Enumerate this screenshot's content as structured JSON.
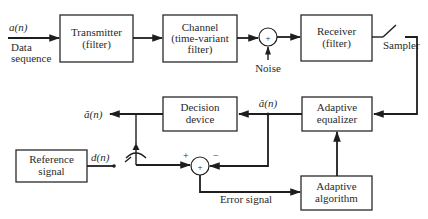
{
  "diagram": {
    "type": "block-diagram",
    "blocks": {
      "transmitter": {
        "line1": "Transmitter",
        "line2": "(filter)"
      },
      "channel": {
        "line1": "Channel",
        "line2": "(time-variant",
        "line3": "filter)"
      },
      "receiver": {
        "line1": "Receiver",
        "line2": "(filter)"
      },
      "decision": {
        "line1": "Decision",
        "line2": "device"
      },
      "equalizer": {
        "line1": "Adaptive",
        "line2": "equalizer"
      },
      "reference": {
        "line1": "Reference",
        "line2": "signal"
      },
      "algorithm": {
        "line1": "Adaptive",
        "line2": "algorithm"
      }
    },
    "labels": {
      "input_symbol": "a(n)",
      "input_desc_1": "Data",
      "input_desc_2": "sequence",
      "noise": "Noise",
      "sampler": "Sampler",
      "equalizer_output": "â(n)",
      "decision_output": "ã(n)",
      "reference_output": "d(n)",
      "error_signal": "Error signal",
      "sum_symbol": "+",
      "plus_sign": "+",
      "minus_sign": "−"
    },
    "colors": {
      "line": "#1e1e1e",
      "text": "#2a2a2a",
      "background": "#ffffff"
    }
  }
}
